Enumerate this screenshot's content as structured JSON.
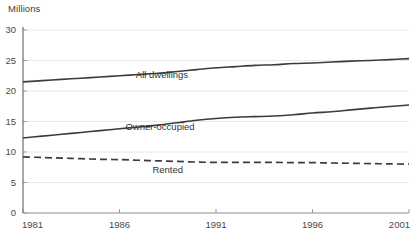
{
  "chart_data": {
    "type": "line",
    "title": "",
    "subtitle": "",
    "ylabel": "Millions",
    "xlabel": "",
    "grid": true,
    "legend_position": "inline-labels",
    "xlim": [
      1981,
      2001
    ],
    "ylim": [
      0,
      30
    ],
    "yticks": [
      0,
      5,
      10,
      15,
      20,
      25,
      30
    ],
    "ytick_labels": [
      "0",
      "5",
      "10",
      "15",
      "20",
      "25",
      "30"
    ],
    "xticks": [
      1981,
      1986,
      1991,
      1996,
      2001
    ],
    "xtick_labels": [
      "1981",
      "1986",
      "1991",
      "1996",
      "2001"
    ],
    "x": [
      1981,
      1982,
      1983,
      1984,
      1985,
      1986,
      1987,
      1988,
      1989,
      1990,
      1991,
      1992,
      1993,
      1994,
      1995,
      1996,
      1997,
      1998,
      1999,
      2000,
      2001
    ],
    "series": [
      {
        "name": "All dwellings",
        "label": "All dwellings",
        "style": "solid",
        "color": "#3c3c3c",
        "label_x": 1988.2,
        "label_y": 22.1,
        "values": [
          21.5,
          21.7,
          21.9,
          22.1,
          22.3,
          22.5,
          22.7,
          22.9,
          23.2,
          23.5,
          23.8,
          24.0,
          24.2,
          24.3,
          24.5,
          24.6,
          24.75,
          24.9,
          25.0,
          25.15,
          25.3
        ]
      },
      {
        "name": "Owner-occupied",
        "label": "Owner-occupied",
        "style": "solid",
        "color": "#3c3c3c",
        "label_x": 1988.1,
        "label_y": 13.6,
        "values": [
          12.3,
          12.6,
          12.9,
          13.2,
          13.5,
          13.8,
          14.1,
          14.4,
          14.8,
          15.2,
          15.5,
          15.7,
          15.8,
          15.9,
          16.1,
          16.4,
          16.6,
          16.9,
          17.2,
          17.45,
          17.7
        ]
      },
      {
        "name": "Rented",
        "label": "Rented",
        "style": "dashed",
        "color": "#3c3c3c",
        "label_x": 1988.5,
        "label_y": 6.6,
        "values": [
          9.2,
          9.1,
          9.0,
          8.9,
          8.8,
          8.75,
          8.65,
          8.55,
          8.45,
          8.35,
          8.3,
          8.3,
          8.3,
          8.3,
          8.25,
          8.25,
          8.2,
          8.15,
          8.1,
          8.05,
          8.0
        ]
      }
    ]
  }
}
